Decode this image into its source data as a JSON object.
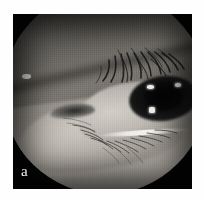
{
  "figure": {
    "kind": "clinical-photograph",
    "modality": "grayscale close-up photograph",
    "panel_label": "a",
    "field_shape": "circular illuminated field on black background",
    "border": "white page margin",
    "colors": {
      "page_background": "#ffffff",
      "frame_background": "#060607",
      "skin_midtone": "#8b8885",
      "skin_highlight": "#cdc9c2",
      "iris_dark": "#0a0a0b",
      "catchlight": "#f3f1ec",
      "label_text": "#f2f2f2"
    },
    "geometry": {
      "plate_left": 13,
      "plate_top": 14,
      "plate_width": 179,
      "plate_height": 175,
      "circle_center_x": 92,
      "circle_center_y": 78,
      "circle_radius": 102
    },
    "features": [
      {
        "name": "upper-eyelid-skin",
        "tone": "dark to mid gray, obliquely lit from lower right"
      },
      {
        "name": "eyelashes-upper",
        "tone": "dark, fanning downward-right across the upper lid margin"
      },
      {
        "name": "medial-canthus",
        "tone": "dark notch at inner corner, left of center"
      },
      {
        "name": "sclera-and-cornea",
        "tone": "light gray globe with dark iris at right"
      },
      {
        "name": "iris-pupil",
        "tone": "near-black disc with three specular catchlights"
      },
      {
        "name": "lower-eyelid-margin",
        "tone": "bright specular line along the lid edge"
      },
      {
        "name": "eyelashes-lower",
        "tone": "fine dark lashes radiating downward"
      },
      {
        "name": "skin-highlight-left",
        "tone": "small bright specular point on cheek skin at left"
      }
    ],
    "catchlights": [
      {
        "id": "catchlight-superior-nasal",
        "x_pct": 70.5,
        "y_pct": 46.5
      },
      {
        "id": "catchlight-superior-temporal",
        "x_pct": 84.5,
        "y_pct": 45.5
      },
      {
        "id": "catchlight-inferior",
        "x_pct": 71.5,
        "y_pct": 57.5
      }
    ]
  }
}
